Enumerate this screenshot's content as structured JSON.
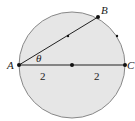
{
  "diagram": {
    "type": "circle-geometry",
    "circle": {
      "cx": 72,
      "cy": 65,
      "r": 53,
      "fill": "#e6e6e6",
      "stroke": "#888888"
    },
    "points": {
      "A": {
        "label": "A",
        "x": 19,
        "y": 65
      },
      "B": {
        "label": "B",
        "x": 98,
        "y": 17
      },
      "C": {
        "label": "C",
        "x": 125,
        "y": 65
      },
      "center": {
        "x": 72,
        "y": 65
      },
      "midAB": {
        "x": 68,
        "y": 36
      },
      "arcMark": {
        "x": 117,
        "y": 36
      }
    },
    "angle_label": "θ",
    "segment_labels": [
      "2",
      "2"
    ]
  }
}
